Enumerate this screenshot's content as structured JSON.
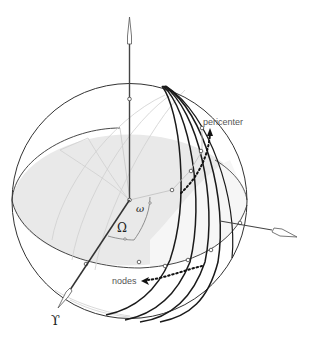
{
  "figure": {
    "colors": {
      "sphere_outline": "#333333",
      "plane_fill": "#e8e8e8",
      "orbit_lines": "#1a1a1a",
      "faint_lines": "#c8c8c8",
      "arrow_dots": "#111111",
      "label_text": "#555555"
    },
    "labels": {
      "pericenter": "pericenter",
      "nodes": "nodes",
      "omega_small": "ω",
      "omega_capital": "Ω",
      "vernal_equinox": "ϒ"
    }
  }
}
